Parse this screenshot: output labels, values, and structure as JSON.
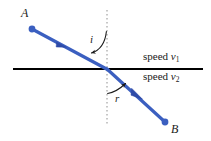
{
  "figure": {
    "width": 211,
    "height": 141,
    "background_color": "#ffffff"
  },
  "colors": {
    "ray": "#3B5FC0",
    "ray_dark": "#2E4BA8",
    "interface_line": "#000000",
    "normal_line": "#AAAAAA",
    "text": "#1a1a1a",
    "arc_arrow": "#1a1a1a"
  },
  "labels": {
    "point_a": "A",
    "point_b": "B",
    "angle_incidence": "i",
    "angle_refraction": "r",
    "speed_upper_text": "speed",
    "speed_upper_symbol": "v",
    "speed_upper_subscript": "1",
    "speed_lower_text": "speed",
    "speed_lower_symbol": "v",
    "speed_lower_subscript": "2"
  },
  "geometry": {
    "interface_line": {
      "x1": 13,
      "y1": 69,
      "x2": 203,
      "y2": 69,
      "width": 1.8
    },
    "normal_line": {
      "x": 107,
      "y1": 10,
      "y2": 125,
      "dash": "1.5 2.5",
      "width": 1.3
    },
    "incident_ray": {
      "x1": 32,
      "y1": 29,
      "x2": 107,
      "y2": 69,
      "width": 3.2
    },
    "refracted_ray": {
      "x1": 107,
      "y1": 69,
      "x2": 165,
      "y2": 122,
      "width": 3.2
    },
    "point_a_dot": {
      "cx": 32,
      "cy": 29,
      "r": 3.4
    },
    "point_b_dot": {
      "cx": 165,
      "cy": 122,
      "r": 3.4
    },
    "incident_arrow_at": {
      "cx": 62,
      "cy": 46
    },
    "refracted_arrow_at": {
      "cx": 138,
      "cy": 96
    },
    "incidence_arc": {
      "start_x": 107,
      "start_y": 30,
      "end_x": 91,
      "end_y": 52
    },
    "refraction_arc": {
      "start_x": 107,
      "start_y": 93,
      "end_x": 128,
      "end_y": 83
    }
  },
  "label_positions": {
    "point_a": {
      "x": 21,
      "y": 8
    },
    "point_b": {
      "x": 171,
      "y": 124
    },
    "angle_incidence": {
      "x": 89,
      "y": 35
    },
    "angle_refraction": {
      "x": 114,
      "y": 93
    },
    "speed_upper": {
      "x": 143,
      "y": 51
    },
    "speed_lower": {
      "x": 143,
      "y": 71
    }
  }
}
